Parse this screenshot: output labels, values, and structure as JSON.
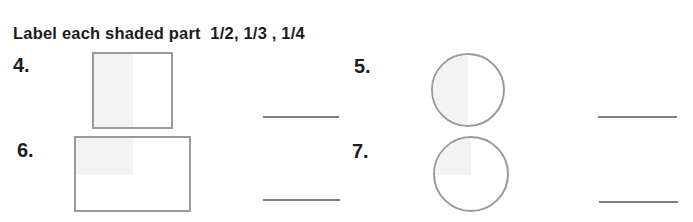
{
  "title": "Label each shaded part  1/2, 1/3 , 1/4",
  "problems": [
    {
      "number": "4.",
      "shape": "square",
      "shaded_part": "left-half",
      "answer_value": ""
    },
    {
      "number": "5.",
      "shape": "circle",
      "shaded_part": "left-half",
      "answer_value": ""
    },
    {
      "number": "6.",
      "shape": "rectangle",
      "shaded_part": "top-left-quarter",
      "answer_value": ""
    },
    {
      "number": "7.",
      "shape": "circle",
      "shaded_part": "top-left-quarter",
      "answer_value": ""
    }
  ],
  "colors": {
    "text": "#1c1c1c",
    "shape_border": "#9b9b9b",
    "answer_line": "#7f7f7f",
    "shade_fill": "#f3f3f3",
    "background": "#ffffff"
  }
}
